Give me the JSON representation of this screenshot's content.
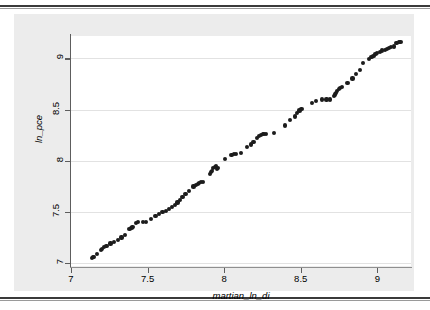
{
  "figure": {
    "background_color": "#ececec",
    "plot_background_color": "#ffffff",
    "marker_color": "#1c1c1c",
    "grid_color": "#e2e2e2",
    "axis_color": "#5d5d5d"
  },
  "chart_data": {
    "type": "scatter",
    "title": "",
    "xlabel": "martian_ln_di",
    "ylabel": "ln_pce",
    "xlim": [
      7.0,
      9.22
    ],
    "ylim": [
      6.97,
      9.22
    ],
    "xticks": [
      7,
      7.5,
      8,
      8.5,
      9
    ],
    "xticklabels": [
      "7",
      "7.5",
      "8",
      "8.5",
      "9"
    ],
    "yticks": [
      7,
      7.5,
      8,
      8.5,
      9
    ],
    "yticklabels": [
      "7",
      "7.5",
      "8",
      "8.5",
      "9"
    ],
    "grid": "horizontal",
    "legend": null,
    "series": [
      {
        "name": "ln_pce vs martian_ln_di",
        "marker": "circle",
        "color": "#1c1c1c",
        "points": [
          [
            7.135,
            7.045
          ],
          [
            7.142,
            7.055
          ],
          [
            7.15,
            7.062
          ],
          [
            7.172,
            7.09
          ],
          [
            7.195,
            7.128
          ],
          [
            7.205,
            7.14
          ],
          [
            7.218,
            7.152
          ],
          [
            7.232,
            7.162
          ],
          [
            7.258,
            7.19
          ],
          [
            7.282,
            7.208
          ],
          [
            7.305,
            7.228
          ],
          [
            7.33,
            7.248
          ],
          [
            7.352,
            7.272
          ],
          [
            7.382,
            7.332
          ],
          [
            7.395,
            7.345
          ],
          [
            7.402,
            7.352
          ],
          [
            7.425,
            7.392
          ],
          [
            7.44,
            7.4
          ],
          [
            7.468,
            7.398
          ],
          [
            7.492,
            7.398
          ],
          [
            7.522,
            7.432
          ],
          [
            7.552,
            7.462
          ],
          [
            7.575,
            7.478
          ],
          [
            7.598,
            7.498
          ],
          [
            7.618,
            7.505
          ],
          [
            7.64,
            7.525
          ],
          [
            7.66,
            7.548
          ],
          [
            7.678,
            7.568
          ],
          [
            7.695,
            7.592
          ],
          [
            7.712,
            7.618
          ],
          [
            7.728,
            7.645
          ],
          [
            7.748,
            7.672
          ],
          [
            7.768,
            7.7
          ],
          [
            7.8,
            7.748
          ],
          [
            7.818,
            7.762
          ],
          [
            7.828,
            7.775
          ],
          [
            7.838,
            7.782
          ],
          [
            7.848,
            7.79
          ],
          [
            7.86,
            7.795
          ],
          [
            7.905,
            7.872
          ],
          [
            7.912,
            7.888
          ],
          [
            7.92,
            7.898
          ],
          [
            7.928,
            7.93
          ],
          [
            7.938,
            7.94
          ],
          [
            7.945,
            7.948
          ],
          [
            7.952,
            7.922
          ],
          [
            7.962,
            7.93
          ],
          [
            8.008,
            8.018
          ],
          [
            8.048,
            8.055
          ],
          [
            8.062,
            8.062
          ],
          [
            8.075,
            8.062
          ],
          [
            8.112,
            8.078
          ],
          [
            8.15,
            8.132
          ],
          [
            8.175,
            8.158
          ],
          [
            8.192,
            8.182
          ],
          [
            8.212,
            8.225
          ],
          [
            8.228,
            8.245
          ],
          [
            8.24,
            8.252
          ],
          [
            8.252,
            8.258
          ],
          [
            8.262,
            8.262
          ],
          [
            8.272,
            8.262
          ],
          [
            8.325,
            8.272
          ],
          [
            8.398,
            8.345
          ],
          [
            8.432,
            8.398
          ],
          [
            8.46,
            8.432
          ],
          [
            8.478,
            8.468
          ],
          [
            8.492,
            8.492
          ],
          [
            8.505,
            8.505
          ],
          [
            8.572,
            8.562
          ],
          [
            8.6,
            8.588
          ],
          [
            8.638,
            8.598
          ],
          [
            8.668,
            8.598
          ],
          [
            8.692,
            8.598
          ],
          [
            8.715,
            8.632
          ],
          [
            8.722,
            8.648
          ],
          [
            8.73,
            8.662
          ],
          [
            8.738,
            8.678
          ],
          [
            8.748,
            8.702
          ],
          [
            8.758,
            8.712
          ],
          [
            8.768,
            8.718
          ],
          [
            8.805,
            8.758
          ],
          [
            8.838,
            8.805
          ],
          [
            8.862,
            8.845
          ],
          [
            8.885,
            8.885
          ],
          [
            8.908,
            8.952
          ],
          [
            8.948,
            8.992
          ],
          [
            8.962,
            9.012
          ],
          [
            8.975,
            9.028
          ],
          [
            8.988,
            9.04
          ],
          [
            9.0,
            9.052
          ],
          [
            9.015,
            9.062
          ],
          [
            9.032,
            9.078
          ],
          [
            9.048,
            9.085
          ],
          [
            9.062,
            9.092
          ],
          [
            9.078,
            9.105
          ],
          [
            9.092,
            9.112
          ],
          [
            9.108,
            9.118
          ],
          [
            9.125,
            9.155
          ],
          [
            9.14,
            9.162
          ],
          [
            9.152,
            9.165
          ]
        ]
      }
    ]
  }
}
